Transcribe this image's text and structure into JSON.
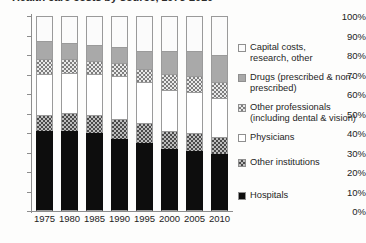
{
  "chart_data": {
    "type": "bar",
    "subtype": "stacked-100-percent",
    "title": "Health care costs by source, 1975-2010",
    "xlabel": "",
    "ylabel": "",
    "ylim": [
      0,
      100
    ],
    "ytick_labels": [
      "0%",
      "10%",
      "20%",
      "30%",
      "40%",
      "50%",
      "60%",
      "70%",
      "80%",
      "90%",
      "100%"
    ],
    "ytick_values": [
      0,
      10,
      20,
      30,
      40,
      50,
      60,
      70,
      80,
      90,
      100
    ],
    "grid": false,
    "legend_position": "right",
    "categories": [
      "1975",
      "1980",
      "1985",
      "1990",
      "1995",
      "2000",
      "2005",
      "2010"
    ],
    "series": [
      {
        "name": "Hospitals",
        "swatch": "solid-black",
        "color": "#0d0d0d",
        "values": [
          41,
          41,
          40,
          37,
          35,
          32,
          31,
          29
        ]
      },
      {
        "name": "Other institutions",
        "swatch": "dark-checker",
        "color": "#4a4a4a",
        "values": [
          8,
          9,
          9,
          10,
          10,
          9,
          9,
          9
        ]
      },
      {
        "name": "Physicians",
        "swatch": "white",
        "color": "#ffffff",
        "values": [
          21,
          21,
          21,
          22,
          21,
          21,
          21,
          20
        ]
      },
      {
        "name": "Other professionals (including dental & vision)",
        "swatch": "mid-checker",
        "color": "#7d7d7d",
        "values": [
          8,
          7,
          7,
          7,
          7,
          8,
          8,
          8
        ]
      },
      {
        "name": "Drugs (prescribed & non-prescribed)",
        "swatch": "solid-gray",
        "color": "#a9a9a9",
        "values": [
          9,
          8,
          8,
          8,
          9,
          12,
          13,
          14
        ]
      },
      {
        "name": "Capital costs, research, other",
        "swatch": "light-dotted",
        "color": "#fbfbfb",
        "values": [
          13,
          14,
          15,
          16,
          18,
          18,
          18,
          20
        ]
      }
    ],
    "legend_entries": [
      "Capital costs,\nresearch, other",
      "Drugs (prescribed & non-\nprescribed)",
      "Other professionals\n(including dental & vision)",
      "Physicians",
      "Other institutions",
      "Hospitals"
    ]
  }
}
